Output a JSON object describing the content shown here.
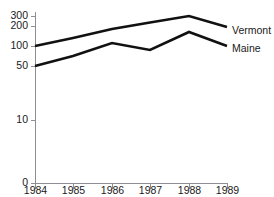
{
  "chart_data": {
    "type": "line",
    "title": "",
    "xlabel": "",
    "ylabel": "",
    "x": [
      "1984",
      "1985",
      "1986",
      "1987",
      "1988",
      "1989"
    ],
    "categories": [
      "1984",
      "1985",
      "1986",
      "1987",
      "1988",
      "1989"
    ],
    "series": [
      {
        "name": "Vermont",
        "values": [
          100,
          140,
          185,
          235,
          300,
          195
        ]
      },
      {
        "name": "Maine",
        "values": [
          50,
          75,
          115,
          90,
          170,
          100
        ]
      }
    ],
    "ytick_labels": [
      "300",
      "200",
      "100",
      "50",
      "10",
      "0"
    ],
    "ytick_values": [
      300,
      200,
      100,
      50,
      10,
      0
    ],
    "ytick_pixel_y": [
      16,
      26,
      46,
      66,
      120,
      183
    ],
    "xtick_labels": [
      "1984",
      "1985",
      "1986",
      "1987",
      "1988",
      "1989"
    ],
    "xtick_pixel_x": [
      35,
      73,
      112,
      150,
      189,
      227
    ],
    "ylim": [
      0,
      300
    ],
    "yscale": "nonlinear-broken",
    "grid": false,
    "legend_position": "right-of-plot",
    "legend": [
      "Vermont",
      "Maine"
    ],
    "line_color": "#111111",
    "axis_color": "#8e8e94"
  },
  "legend": {
    "vermont_label": "Vermont",
    "maine_label": "Maine"
  },
  "axes": {
    "y_labels": {
      "t300": "300",
      "t200": "200",
      "t100": "100",
      "t50": "50",
      "t10": "10",
      "t0": "0"
    },
    "x_labels": {
      "y1984": "1984",
      "y1985": "1985",
      "y1986": "1986",
      "y1987": "1987",
      "y1988": "1988",
      "y1989": "1989"
    }
  },
  "title": {
    "text": ""
  }
}
